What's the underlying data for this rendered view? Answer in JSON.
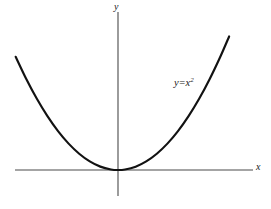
{
  "figure": {
    "background_color": "#ffffff",
    "width": 271,
    "height": 209
  },
  "axes": {
    "x_label": "x",
    "y_label": "y",
    "axis_color": "#4a4a4a",
    "origin_px": {
      "x": 118,
      "y": 170
    },
    "x_axis_extent_px": {
      "start": 15,
      "end": 253
    },
    "y_axis_extent_px": {
      "start": 12,
      "end": 196
    },
    "ticks": [],
    "grid": false
  },
  "curve": {
    "label_parts": {
      "variable": "y",
      "operator": "=",
      "base": "x",
      "exponent": "2"
    },
    "label_text": "y=x²",
    "color": "#121212",
    "stroke_width": 2.15
  },
  "chart_data": {
    "type": "line",
    "title": "",
    "subtitle": "",
    "xlabel": "x",
    "ylabel": "y",
    "grid": false,
    "legend_position": "inline-annotation",
    "annotations": [
      {
        "text": "y=x²",
        "x": 2.55,
        "y": 6.5,
        "style": "italic-serif"
      }
    ],
    "xlim": [
      -3.2,
      3.6
    ],
    "ylim": [
      -0.6,
      10.4
    ],
    "series": [
      {
        "name": "y=x²",
        "equation": "y = x^2",
        "color": "#121212",
        "x": [
          -2.9,
          -2.6,
          -2.3,
          -2.0,
          -1.7,
          -1.4,
          -1.1,
          -0.8,
          -0.5,
          -0.2,
          0.0,
          0.2,
          0.5,
          0.8,
          1.1,
          1.4,
          1.7,
          2.0,
          2.3,
          2.6,
          2.9,
          3.15
        ],
        "values": [
          8.41,
          6.76,
          5.29,
          4.0,
          2.89,
          1.96,
          1.21,
          0.64,
          0.25,
          0.04,
          0.0,
          0.04,
          0.25,
          0.64,
          1.21,
          1.96,
          2.89,
          4.0,
          5.29,
          6.76,
          8.41,
          9.92
        ]
      }
    ],
    "vertex": {
      "x": 0,
      "y": 0
    }
  }
}
